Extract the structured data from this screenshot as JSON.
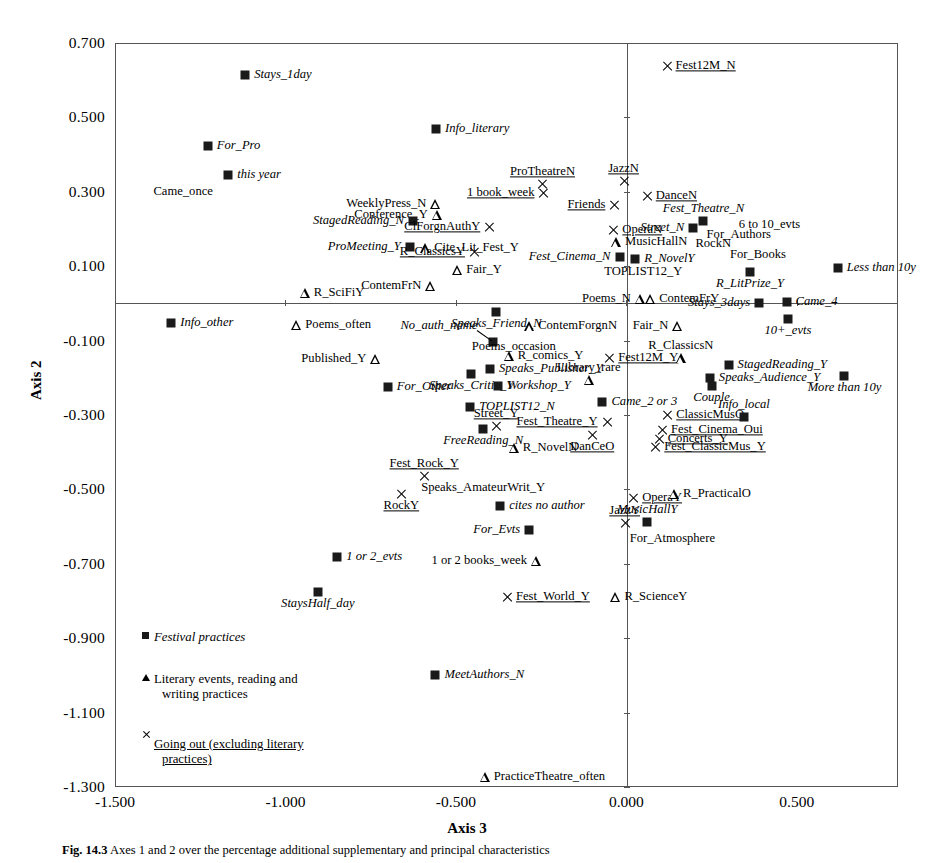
{
  "chart_data": {
    "type": "scatter",
    "title": "",
    "xlabel": "Axis 3",
    "ylabel": "Axis 2",
    "xlim": [
      -1.5,
      0.797
    ],
    "ylim": [
      -1.3,
      0.7
    ],
    "xticks": [
      -1.5,
      -1.0,
      -0.5,
      0.0,
      0.5
    ],
    "yticks": [
      0.7,
      0.5,
      0.3,
      0.1,
      -0.1,
      -0.3,
      -0.5,
      -0.7,
      -0.9,
      -1.1,
      -1.3
    ],
    "xticklabels": [
      "-1.500",
      "-1.000",
      "-0.500",
      "0.000",
      "0.500"
    ],
    "yticklabels": [
      "0.700",
      "0.500",
      "0.300",
      "0.100",
      "-0.100",
      "-0.300",
      "-0.500",
      "-0.700",
      "-0.900",
      "-1.100",
      "-1.300"
    ],
    "grid": false,
    "zero_lines": true,
    "legend_position": "lower-left-inside",
    "series": [
      {
        "name": "Festival practices",
        "marker": "square",
        "style": "italic"
      },
      {
        "name": "Literary events, reading and writing practices",
        "marker": "triangle",
        "style": "normal"
      },
      {
        "name": "Going out (excluding literary practices)",
        "marker": "x",
        "style": "underline"
      }
    ],
    "points": [
      {
        "label": "Stays_1day",
        "x": -1.118,
        "y": 0.614,
        "marker": "square",
        "pos": "right"
      },
      {
        "label": "For_Pro",
        "x": -1.228,
        "y": 0.423,
        "marker": "square",
        "pos": "right"
      },
      {
        "label": "this year",
        "x": -1.168,
        "y": 0.345,
        "marker": "square",
        "pos": "right"
      },
      {
        "label": "Came_once",
        "x": -1.3,
        "y": 0.3,
        "marker": "none",
        "pos": "label-only"
      },
      {
        "label": "Info_literary",
        "x": -0.558,
        "y": 0.47,
        "marker": "square",
        "pos": "right"
      },
      {
        "label": "Fest12M_N",
        "x": 0.118,
        "y": 0.637,
        "marker": "x",
        "pos": "right"
      },
      {
        "label": "ProTheatreN",
        "x": -0.246,
        "y": 0.32,
        "marker": "x",
        "pos": "above"
      },
      {
        "label": "1 book_week",
        "x": -0.243,
        "y": 0.297,
        "marker": "x",
        "pos": "left"
      },
      {
        "label": "JazzN",
        "x": -0.008,
        "y": 0.33,
        "marker": "x",
        "pos": "above"
      },
      {
        "label": "DanceN",
        "x": 0.06,
        "y": 0.29,
        "marker": "x",
        "pos": "right"
      },
      {
        "label": "WeeklyPress_N",
        "x": -0.56,
        "y": 0.267,
        "marker": "triangle",
        "pos": "left"
      },
      {
        "label": "Conference_Y",
        "x": -0.556,
        "y": 0.237,
        "marker": "triangle",
        "pos": "left"
      },
      {
        "label": "Friends",
        "x": -0.035,
        "y": 0.265,
        "marker": "x",
        "pos": "left"
      },
      {
        "label": "StagedReading_N",
        "x": -0.626,
        "y": 0.221,
        "marker": "square",
        "pos": "left"
      },
      {
        "label": "ClForgnAuthY",
        "x": -0.402,
        "y": 0.205,
        "marker": "x",
        "pos": "left"
      },
      {
        "label": "Fest_Theatre_N",
        "x": 0.226,
        "y": 0.222,
        "marker": "square",
        "pos": "above"
      },
      {
        "label": "Street_N",
        "x": 0.196,
        "y": 0.203,
        "marker": "square",
        "pos": "left"
      },
      {
        "label": "6 to 10_evts",
        "x": 0.42,
        "y": 0.212,
        "marker": "none",
        "pos": "label-only"
      },
      {
        "label": "OperaN",
        "x": -0.038,
        "y": 0.196,
        "marker": "x",
        "pos": "right"
      },
      {
        "label": "For_Authors",
        "x": 0.33,
        "y": 0.183,
        "marker": "none",
        "pos": "label-only"
      },
      {
        "label": "ProMeeting_Y",
        "x": -0.635,
        "y": 0.152,
        "marker": "square",
        "pos": "left"
      },
      {
        "label": "Cite_Lit_Fest_Y",
        "x": -0.59,
        "y": 0.148,
        "marker": "triangle",
        "pos": "right"
      },
      {
        "label": "MusicHallN",
        "x": -0.03,
        "y": 0.164,
        "marker": "triangle",
        "pos": "right"
      },
      {
        "label": "RockN",
        "x": 0.255,
        "y": 0.16,
        "marker": "none",
        "pos": "label-only"
      },
      {
        "label": "R_ClassicsY",
        "x": -0.447,
        "y": 0.139,
        "marker": "x",
        "pos": "left"
      },
      {
        "label": "Fest_Cinema_N",
        "x": -0.02,
        "y": 0.126,
        "marker": "square",
        "pos": "left"
      },
      {
        "label": "R_NovelY",
        "x": 0.026,
        "y": 0.12,
        "marker": "square",
        "pos": "right"
      },
      {
        "label": "For_Books",
        "x": 0.386,
        "y": 0.131,
        "marker": "none",
        "pos": "label-only"
      },
      {
        "label": "Fair_Y",
        "x": -0.496,
        "y": 0.09,
        "marker": "triangle",
        "pos": "right"
      },
      {
        "label": "TOPLIST12_Y",
        "x": 0.05,
        "y": 0.085,
        "marker": "none",
        "pos": "label-only"
      },
      {
        "label": "R_LitPrize_Y",
        "x": 0.363,
        "y": 0.085,
        "marker": "square",
        "pos": "below"
      },
      {
        "label": "Less than 10y",
        "x": 0.62,
        "y": 0.094,
        "marker": "square",
        "pos": "right"
      },
      {
        "label": "ContemFrN",
        "x": -0.575,
        "y": 0.046,
        "marker": "triangle",
        "pos": "left"
      },
      {
        "label": "R_SciFiY",
        "x": -0.943,
        "y": 0.028,
        "marker": "triangle",
        "pos": "right"
      },
      {
        "label": "Poems_N",
        "x": 0.04,
        "y": 0.013,
        "marker": "triangle",
        "pos": "left"
      },
      {
        "label": "ContemFrY",
        "x": 0.07,
        "y": 0.013,
        "marker": "triangle",
        "pos": "right"
      },
      {
        "label": "Stays_3days",
        "x": 0.39,
        "y": 0.002,
        "marker": "square",
        "pos": "left"
      },
      {
        "label": "Came_4",
        "x": 0.47,
        "y": 0.004,
        "marker": "square",
        "pos": "right"
      },
      {
        "label": "Speaks_Friend_N",
        "x": -0.381,
        "y": -0.024,
        "marker": "square",
        "pos": "below"
      },
      {
        "label": "Info_other",
        "x": -1.335,
        "y": -0.053,
        "marker": "square",
        "pos": "right"
      },
      {
        "label": "Poems_often",
        "x": -0.968,
        "y": -0.057,
        "marker": "triangle",
        "pos": "right"
      },
      {
        "label": "ContemForgnN",
        "x": -0.285,
        "y": -0.062,
        "marker": "triangle",
        "pos": "right"
      },
      {
        "label": "Fair_N",
        "x": 0.15,
        "y": -0.06,
        "marker": "triangle",
        "pos": "left"
      },
      {
        "label": "10+_evts",
        "x": 0.474,
        "y": -0.042,
        "marker": "square",
        "pos": "below"
      },
      {
        "label": "No_auth_name",
        "x": -0.39,
        "y": -0.105,
        "marker": "square",
        "pos": "leader"
      },
      {
        "label": "Poems_occasion",
        "x": -0.33,
        "y": -0.117,
        "marker": "none",
        "pos": "label-only"
      },
      {
        "label": "R_comics_Y",
        "x": -0.345,
        "y": -0.142,
        "marker": "triangle",
        "pos": "right"
      },
      {
        "label": "Published_Y",
        "x": -0.736,
        "y": -0.15,
        "marker": "triangle",
        "pos": "left"
      },
      {
        "label": "Fest12M_Y",
        "x": -0.05,
        "y": -0.148,
        "marker": "x",
        "pos": "right"
      },
      {
        "label": "R_ClassicsN",
        "x": 0.16,
        "y": -0.148,
        "marker": "triangle",
        "pos": "above"
      },
      {
        "label": "Speaks_Publisher_Y",
        "x": -0.4,
        "y": -0.175,
        "marker": "square",
        "pos": "right"
      },
      {
        "label": "StagedReading_Y",
        "x": 0.3,
        "y": -0.165,
        "marker": "square",
        "pos": "right"
      },
      {
        "label": "Speaks_Critic_Y",
        "x": -0.455,
        "y": -0.19,
        "marker": "square",
        "pos": "below"
      },
      {
        "label": "Speaks_Audience_Y",
        "x": 0.245,
        "y": -0.2,
        "marker": "square",
        "pos": "right"
      },
      {
        "label": "More than 10y",
        "x": 0.64,
        "y": -0.195,
        "marker": "square",
        "pos": "below"
      },
      {
        "label": "For_Other",
        "x": -0.7,
        "y": -0.225,
        "marker": "square",
        "pos": "right"
      },
      {
        "label": "Workshop_Y",
        "x": -0.375,
        "y": -0.222,
        "marker": "square",
        "pos": "right"
      },
      {
        "label": "Library_rare",
        "x": -0.11,
        "y": -0.205,
        "marker": "triangle",
        "pos": "above"
      },
      {
        "label": "Couple",
        "x": 0.25,
        "y": -0.222,
        "marker": "square",
        "pos": "below"
      },
      {
        "label": "Came_2 or 3",
        "x": -0.07,
        "y": -0.266,
        "marker": "square",
        "pos": "right"
      },
      {
        "label": "TOPLIST12_N",
        "x": -0.458,
        "y": -0.278,
        "marker": "square",
        "pos": "right"
      },
      {
        "label": "ClassicMusO",
        "x": 0.12,
        "y": -0.3,
        "marker": "x",
        "pos": "right"
      },
      {
        "label": "Info_local",
        "x": 0.345,
        "y": -0.305,
        "marker": "square",
        "pos": "above"
      },
      {
        "label": "Street_Y",
        "x": -0.382,
        "y": -0.33,
        "marker": "x",
        "pos": "above"
      },
      {
        "label": "Fest_Theatre_Y",
        "x": -0.058,
        "y": -0.32,
        "marker": "x",
        "pos": "left"
      },
      {
        "label": "FreeReading_N",
        "x": -0.42,
        "y": -0.337,
        "marker": "square",
        "pos": "below"
      },
      {
        "label": "Fest_Cinema_Oui",
        "x": 0.105,
        "y": -0.34,
        "marker": "x",
        "pos": "right"
      },
      {
        "label": "Concerts_Y",
        "x": 0.095,
        "y": -0.365,
        "marker": "x",
        "pos": "right"
      },
      {
        "label": "DanCeO",
        "x": -0.1,
        "y": -0.355,
        "marker": "x",
        "pos": "below"
      },
      {
        "label": "Fest_ClassicMus_Y",
        "x": 0.085,
        "y": -0.387,
        "marker": "x",
        "pos": "right"
      },
      {
        "label": "R_NovelN",
        "x": -0.33,
        "y": -0.388,
        "marker": "triangle",
        "pos": "right"
      },
      {
        "label": "Fest_Rock_Y",
        "x": -0.593,
        "y": -0.463,
        "marker": "x",
        "pos": "above"
      },
      {
        "label": "Speaks_AmateurWrit_Y",
        "x": -0.42,
        "y": -0.495,
        "marker": "none",
        "pos": "label-only"
      },
      {
        "label": "RockY",
        "x": -0.66,
        "y": -0.512,
        "marker": "x",
        "pos": "below"
      },
      {
        "label": "OperaY",
        "x": 0.02,
        "y": -0.522,
        "marker": "x",
        "pos": "right"
      },
      {
        "label": "R_PracticalO",
        "x": 0.14,
        "y": -0.512,
        "marker": "triangle",
        "pos": "right"
      },
      {
        "label": "cites no author",
        "x": -0.37,
        "y": -0.545,
        "marker": "square",
        "pos": "right"
      },
      {
        "label": "JazzY",
        "x": -0.005,
        "y": -0.59,
        "marker": "x",
        "pos": "above"
      },
      {
        "label": "MusicHallY",
        "x": 0.062,
        "y": -0.588,
        "marker": "square",
        "pos": "above"
      },
      {
        "label": "For_Evts",
        "x": -0.285,
        "y": -0.61,
        "marker": "square",
        "pos": "left"
      },
      {
        "label": "For_Atmosphere",
        "x": 0.135,
        "y": -0.632,
        "marker": "none",
        "pos": "label-only"
      },
      {
        "label": "1 or 2_evts",
        "x": -0.848,
        "y": -0.683,
        "marker": "square",
        "pos": "right"
      },
      {
        "label": "1 or 2 books_week",
        "x": -0.265,
        "y": -0.693,
        "marker": "triangle",
        "pos": "left"
      },
      {
        "label": "StaysHalf_day",
        "x": -0.905,
        "y": -0.775,
        "marker": "square",
        "pos": "below"
      },
      {
        "label": "Fest_World_Y",
        "x": -0.35,
        "y": -0.79,
        "marker": "x",
        "pos": "right"
      },
      {
        "label": "R_ScienceY",
        "x": -0.032,
        "y": -0.79,
        "marker": "triangle",
        "pos": "right"
      },
      {
        "label": "Festival practices",
        "x": -1.38,
        "y": -0.905,
        "marker": "none",
        "pos": "legend-hidden"
      },
      {
        "label": "MeetAuthors_N",
        "x": -0.56,
        "y": -1.0,
        "marker": "square",
        "pos": "right"
      },
      {
        "label": "PracticeTheatre_often",
        "x": -0.415,
        "y": -1.272,
        "marker": "triangle",
        "pos": "right"
      }
    ]
  },
  "legend": {
    "items": [
      {
        "marker": "square",
        "text": "Festival practices",
        "style": "italic"
      },
      {
        "marker": "triangle",
        "text": "Literary events, reading and",
        "text2": "writing practices",
        "style": "normal"
      },
      {
        "marker": "x",
        "text": "Going out (excluding literary",
        "text2": "practices)",
        "style": "underline"
      }
    ]
  },
  "caption": {
    "number": "Fig. 14.3",
    "text": "Axes 1 and 2 over the percentage additional supplementary and principal characteristics"
  }
}
